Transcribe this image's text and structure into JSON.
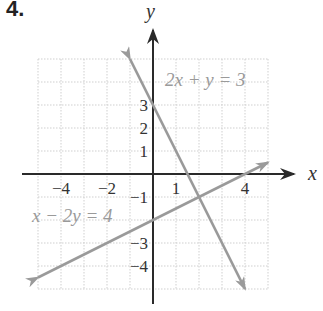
{
  "problem": {
    "number": "4."
  },
  "axes": {
    "x_label": "x",
    "y_label": "y",
    "x_ticks": [
      {
        "value": -4,
        "label": "−4"
      },
      {
        "value": -2,
        "label": "−2"
      },
      {
        "value": 1,
        "label": "1"
      },
      {
        "value": 4,
        "label": "4"
      }
    ],
    "y_ticks": [
      {
        "value": 3,
        "label": "3"
      },
      {
        "value": 2,
        "label": "2"
      },
      {
        "value": 1,
        "label": "1"
      },
      {
        "value": -1,
        "label": "−1"
      },
      {
        "value": -3,
        "label": "−3"
      },
      {
        "value": -4,
        "label": "−4"
      }
    ]
  },
  "grid": {
    "xmin": -5,
    "xmax": 5,
    "ymin": -5,
    "ymax": 5,
    "step": 1
  },
  "lines": [
    {
      "equation": "2x + y = 3",
      "from": [
        -1,
        5
      ],
      "to": [
        4,
        -5
      ],
      "color": "#9a9a9a"
    },
    {
      "equation": "x − 2y = 4",
      "from": [
        -5,
        -4.5
      ],
      "to": [
        5,
        0.5
      ],
      "color": "#9a9a9a"
    }
  ],
  "intersection": {
    "x": 2,
    "y": -1
  },
  "colors": {
    "axis": "#2a2a2a",
    "grid": "#cfcfcf",
    "line": "#9a9a9a",
    "label": "#9a9a9a",
    "text": "#333333"
  }
}
